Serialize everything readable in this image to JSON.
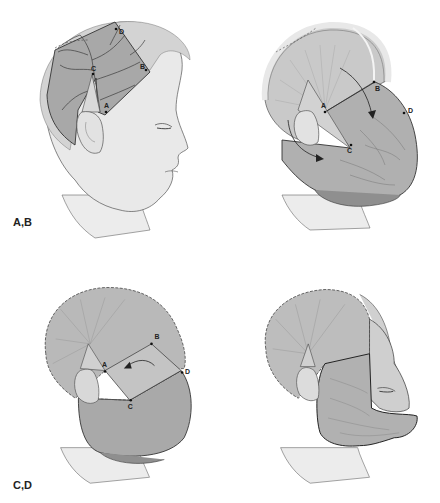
{
  "figure": {
    "panel_groups": [
      {
        "label": "A,B"
      },
      {
        "label": "C,D"
      }
    ],
    "panels": [
      {
        "id": "A",
        "description": "Profile head with outlined scalp flap, vessels, points A-D",
        "points": [
          {
            "name": "A"
          },
          {
            "name": "B"
          },
          {
            "name": "C"
          },
          {
            "name": "D"
          }
        ]
      },
      {
        "id": "B",
        "description": "Flap rotated forward over face, arrows showing rotation",
        "points": [
          {
            "name": "A"
          },
          {
            "name": "B"
          },
          {
            "name": "C"
          },
          {
            "name": "D"
          }
        ]
      },
      {
        "id": "C",
        "description": "Flap sutured with dashed suture lines, curved arrow",
        "points": [
          {
            "name": "A"
          },
          {
            "name": "B"
          },
          {
            "name": "C"
          },
          {
            "name": "D"
          }
        ]
      },
      {
        "id": "D",
        "description": "Final flap inset covering lower face",
        "points": []
      }
    ],
    "colors": {
      "skin": "#e6e6e6",
      "flap": "#b5b5b5",
      "flap_dark": "#8e8e8e",
      "outline": "#3a3a3a",
      "hair": "#d4d4d4",
      "background": "#ffffff"
    }
  }
}
